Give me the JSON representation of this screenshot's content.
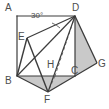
{
  "figure": {
    "kind": "geometry-diagram",
    "background_color": "#ffffff",
    "stroke_color": "#3c3c3c",
    "shade_color": "#c9c9c9",
    "label_color": "#4d4d4d",
    "width": 109,
    "height": 109
  },
  "labels": {
    "A": "A",
    "B": "B",
    "C": "C",
    "D": "D",
    "E": "E",
    "F": "F",
    "G": "G",
    "H": "H",
    "angle": "30°"
  },
  "points": {
    "A": {
      "x": 17,
      "y": 16
    },
    "B": {
      "x": 17,
      "y": 76
    },
    "C": {
      "x": 75,
      "y": 76
    },
    "D": {
      "x": 75,
      "y": 16
    },
    "E": {
      "x": 27,
      "y": 38
    },
    "F": {
      "x": 48,
      "y": 92
    },
    "G": {
      "x": 97,
      "y": 63
    },
    "H": {
      "x": 55,
      "y": 76
    }
  },
  "label_positions": {
    "A": {
      "x": 5,
      "y": 3
    },
    "B": {
      "x": 5,
      "y": 76
    },
    "C": {
      "x": 71,
      "y": 66
    },
    "D": {
      "x": 72,
      "y": 3
    },
    "E": {
      "x": 18,
      "y": 32
    },
    "F": {
      "x": 44,
      "y": 95
    },
    "G": {
      "x": 98,
      "y": 59
    },
    "H": {
      "x": 47,
      "y": 60
    },
    "angle": {
      "x": 31,
      "y": 12
    }
  },
  "shaded_regions": [
    {
      "name": "region-bfgc",
      "polygon": "17,76 48,92 97,63 75,76"
    },
    {
      "name": "region-dcg",
      "polygon": "75,16 97,63 75,76"
    }
  ],
  "solid_segments": [
    {
      "name": "segment-ab",
      "from": "A",
      "to": "B"
    },
    {
      "name": "segment-ad",
      "from": "A",
      "to": "D"
    },
    {
      "name": "segment-bc",
      "from": "B",
      "to": "C"
    },
    {
      "name": "segment-dc",
      "from": "D",
      "to": "C"
    },
    {
      "name": "segment-de",
      "from": "D",
      "to": "E"
    },
    {
      "name": "segment-db",
      "from": "D",
      "to": "B"
    },
    {
      "name": "segment-df",
      "from": "D",
      "to": "F"
    },
    {
      "name": "segment-dg",
      "from": "D",
      "to": "G"
    },
    {
      "name": "segment-eb",
      "from": "E",
      "to": "B"
    },
    {
      "name": "segment-ef",
      "from": "E",
      "to": "F"
    },
    {
      "name": "segment-bf",
      "from": "B",
      "to": "F"
    },
    {
      "name": "segment-fg",
      "from": "F",
      "to": "G"
    },
    {
      "name": "segment-cg",
      "from": "C",
      "to": "G"
    }
  ],
  "dashed_segments": [
    {
      "name": "segment-dh-dashed",
      "from": "D",
      "to": "H"
    },
    {
      "name": "segment-hf-dashed",
      "from": "H",
      "to": "F"
    }
  ]
}
